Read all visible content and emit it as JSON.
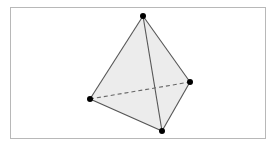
{
  "diagram": {
    "type": "tetrahedron",
    "colors": {
      "face_fill": "#ececec",
      "edge": "#555555",
      "hidden_edge": "#666666",
      "vertex": "#000000",
      "frame": "#b8b8b8"
    },
    "vertices": [
      {
        "id": "top"
      },
      {
        "id": "left"
      },
      {
        "id": "right"
      },
      {
        "id": "bottom"
      }
    ],
    "edges": [
      {
        "from": "top",
        "to": "left",
        "hidden": false
      },
      {
        "from": "top",
        "to": "right",
        "hidden": false
      },
      {
        "from": "top",
        "to": "bottom",
        "hidden": false
      },
      {
        "from": "left",
        "to": "bottom",
        "hidden": false
      },
      {
        "from": "right",
        "to": "bottom",
        "hidden": false
      },
      {
        "from": "left",
        "to": "right",
        "hidden": true
      }
    ]
  }
}
